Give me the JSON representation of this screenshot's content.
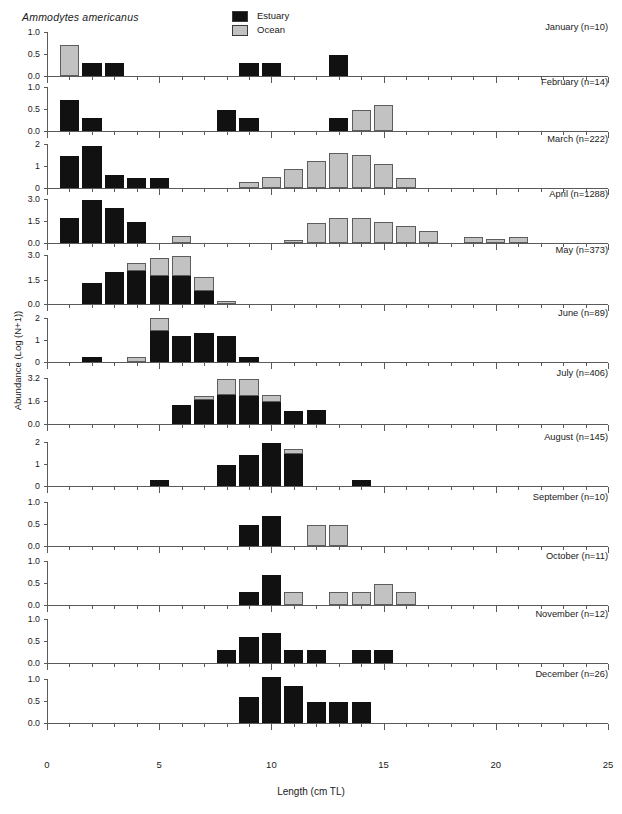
{
  "figure": {
    "species": "Ammodytes americanus",
    "xlabel": "Length (cm TL)",
    "ylabel": "Abundance (Log (N+1))"
  },
  "legend": {
    "position": "top-center",
    "items": [
      {
        "label": "Estuary",
        "color": "#111111",
        "key": "estuary"
      },
      {
        "label": "Ocean",
        "color": "#c2c2c2",
        "key": "ocean"
      }
    ]
  },
  "axes": {
    "x_ticks_major": [
      0,
      5,
      10,
      15,
      20,
      25
    ],
    "x_tick_labels": [
      "0",
      "5",
      "10",
      "15",
      "20",
      "25"
    ],
    "x_minor_step": 1,
    "xlim": [
      0,
      25
    ]
  },
  "chart_data": {
    "type": "bar",
    "title": "Ammodytes americanus",
    "xlabel": "Length (cm TL)",
    "ylabel": "Abundance (Log (N+1))",
    "xlim": [
      0,
      25
    ],
    "grid": false,
    "legend_position": "top-center",
    "stacking": "stacked",
    "series_names": [
      "Estuary",
      "Ocean"
    ],
    "panels": [
      {
        "month": "January",
        "n": 10,
        "title": "January (n=10)",
        "ylim": [
          0,
          1.0
        ],
        "yticks": [
          0.0,
          0.5,
          1.0
        ],
        "ytick_labels": [
          "0.0",
          "0.5",
          "1.0"
        ],
        "estuary": [
          {
            "x": 2,
            "y": 0.3
          },
          {
            "x": 3,
            "y": 0.3
          },
          {
            "x": 9,
            "y": 0.3
          },
          {
            "x": 10,
            "y": 0.3
          },
          {
            "x": 13,
            "y": 0.48
          }
        ],
        "ocean": [
          {
            "x": 1,
            "y": 0.7
          }
        ]
      },
      {
        "month": "February",
        "n": 14,
        "title": "February (n=14)",
        "ylim": [
          0,
          1.0
        ],
        "yticks": [
          0.0,
          0.5,
          1.0
        ],
        "ytick_labels": [
          "0.0",
          "0.5",
          "1.0"
        ],
        "estuary": [
          {
            "x": 1,
            "y": 0.7
          },
          {
            "x": 2,
            "y": 0.3
          },
          {
            "x": 8,
            "y": 0.48
          },
          {
            "x": 9,
            "y": 0.3
          },
          {
            "x": 13,
            "y": 0.3
          }
        ],
        "ocean": [
          {
            "x": 14,
            "y": 0.48
          },
          {
            "x": 15,
            "y": 0.6
          }
        ]
      },
      {
        "month": "March",
        "n": 222,
        "title": "March (n=222)",
        "ylim": [
          0,
          2
        ],
        "yticks": [
          0,
          1,
          2
        ],
        "ytick_labels": [
          "0",
          "1",
          "2"
        ],
        "estuary": [
          {
            "x": 1,
            "y": 1.47
          },
          {
            "x": 2,
            "y": 1.9
          },
          {
            "x": 3,
            "y": 0.6
          },
          {
            "x": 4,
            "y": 0.47
          },
          {
            "x": 5,
            "y": 0.47
          }
        ],
        "ocean": [
          {
            "x": 9,
            "y": 0.28
          },
          {
            "x": 10,
            "y": 0.48
          },
          {
            "x": 11,
            "y": 0.85
          },
          {
            "x": 12,
            "y": 1.25
          },
          {
            "x": 13,
            "y": 1.57
          },
          {
            "x": 14,
            "y": 1.5
          },
          {
            "x": 15,
            "y": 1.1
          },
          {
            "x": 16,
            "y": 0.47
          }
        ]
      },
      {
        "month": "April",
        "n": 1288,
        "title": "April (n=1288)",
        "ylim": [
          0,
          3.0
        ],
        "yticks": [
          0.0,
          1.5,
          3.0
        ],
        "ytick_labels": [
          "0.0",
          "1.5",
          "3.0"
        ],
        "estuary": [
          {
            "x": 1,
            "y": 1.7
          },
          {
            "x": 2,
            "y": 2.9
          },
          {
            "x": 3,
            "y": 2.4
          },
          {
            "x": 4,
            "y": 1.4
          }
        ],
        "ocean": [
          {
            "x": 6,
            "y": 0.5
          },
          {
            "x": 11,
            "y": 0.22
          },
          {
            "x": 12,
            "y": 1.35
          },
          {
            "x": 13,
            "y": 1.7
          },
          {
            "x": 14,
            "y": 1.72
          },
          {
            "x": 15,
            "y": 1.45
          },
          {
            "x": 16,
            "y": 1.18
          },
          {
            "x": 17,
            "y": 0.85
          },
          {
            "x": 19,
            "y": 0.38
          },
          {
            "x": 20,
            "y": 0.25
          },
          {
            "x": 21,
            "y": 0.4
          }
        ]
      },
      {
        "month": "May",
        "n": 373,
        "title": "May (n=373)",
        "ylim": [
          0,
          3.0
        ],
        "yticks": [
          0.0,
          1.5,
          3.0
        ],
        "ytick_labels": [
          "0.0",
          "1.5",
          "3.0"
        ],
        "estuary": [
          {
            "x": 2,
            "y": 1.27
          },
          {
            "x": 3,
            "y": 1.95
          },
          {
            "x": 4,
            "y": 2.05
          },
          {
            "x": 5,
            "y": 1.7
          },
          {
            "x": 6,
            "y": 1.73
          },
          {
            "x": 7,
            "y": 0.8
          }
        ],
        "ocean": [
          {
            "x": 4,
            "y": 0.45
          },
          {
            "x": 5,
            "y": 1.1
          },
          {
            "x": 6,
            "y": 1.22
          },
          {
            "x": 7,
            "y": 0.85
          },
          {
            "x": 8,
            "y": 0.2
          }
        ]
      },
      {
        "month": "June",
        "n": 89,
        "title": "June (n=89)",
        "ylim": [
          0,
          2
        ],
        "yticks": [
          0,
          1,
          2
        ],
        "ytick_labels": [
          "0",
          "1",
          "2"
        ],
        "estuary": [
          {
            "x": 2,
            "y": 0.25
          },
          {
            "x": 5,
            "y": 1.4
          },
          {
            "x": 6,
            "y": 1.2
          },
          {
            "x": 7,
            "y": 1.3
          },
          {
            "x": 8,
            "y": 1.2
          },
          {
            "x": 9,
            "y": 0.25
          }
        ],
        "ocean": [
          {
            "x": 4,
            "y": 0.25
          },
          {
            "x": 5,
            "y": 0.62
          }
        ]
      },
      {
        "month": "July",
        "n": 406,
        "title": "July (n=406)",
        "ylim": [
          0,
          3.2
        ],
        "yticks": [
          0.0,
          1.6,
          3.2
        ],
        "ytick_labels": [
          "0.0",
          "1.6",
          "3.2"
        ],
        "estuary": [
          {
            "x": 6,
            "y": 1.35
          },
          {
            "x": 7,
            "y": 1.7
          },
          {
            "x": 8,
            "y": 2.05
          },
          {
            "x": 9,
            "y": 1.92
          },
          {
            "x": 10,
            "y": 1.5
          },
          {
            "x": 11,
            "y": 0.9
          },
          {
            "x": 12,
            "y": 1.0
          }
        ],
        "ocean": [
          {
            "x": 7,
            "y": 0.22
          },
          {
            "x": 8,
            "y": 1.1
          },
          {
            "x": 9,
            "y": 1.18
          },
          {
            "x": 10,
            "y": 0.55
          }
        ]
      },
      {
        "month": "August",
        "n": 145,
        "title": "August (n=145)",
        "ylim": [
          0,
          2
        ],
        "yticks": [
          0,
          1,
          2
        ],
        "ytick_labels": [
          "0",
          "1",
          "2"
        ],
        "estuary": [
          {
            "x": 5,
            "y": 0.27
          },
          {
            "x": 8,
            "y": 0.95
          },
          {
            "x": 9,
            "y": 1.4
          },
          {
            "x": 10,
            "y": 1.95
          },
          {
            "x": 11,
            "y": 1.45
          },
          {
            "x": 14,
            "y": 0.27
          }
        ],
        "ocean": [
          {
            "x": 11,
            "y": 0.22
          }
        ]
      },
      {
        "month": "September",
        "n": 10,
        "title": "September (n=10)",
        "ylim": [
          0,
          1.0
        ],
        "yticks": [
          0.0,
          0.5,
          1.0
        ],
        "ytick_labels": [
          "0.0",
          "0.5",
          "1.0"
        ],
        "estuary": [
          {
            "x": 9,
            "y": 0.47
          },
          {
            "x": 10,
            "y": 0.68
          }
        ],
        "ocean": [
          {
            "x": 12,
            "y": 0.47
          },
          {
            "x": 13,
            "y": 0.47
          }
        ]
      },
      {
        "month": "October",
        "n": 11,
        "title": "October (n=11)",
        "ylim": [
          0,
          1.0
        ],
        "yticks": [
          0.0,
          0.5,
          1.0
        ],
        "ytick_labels": [
          "0.0",
          "0.5",
          "1.0"
        ],
        "estuary": [
          {
            "x": 9,
            "y": 0.3
          },
          {
            "x": 10,
            "y": 0.68
          }
        ],
        "ocean": [
          {
            "x": 11,
            "y": 0.3
          },
          {
            "x": 13,
            "y": 0.3
          },
          {
            "x": 14,
            "y": 0.3
          },
          {
            "x": 15,
            "y": 0.48
          },
          {
            "x": 16,
            "y": 0.3
          }
        ]
      },
      {
        "month": "November",
        "n": 12,
        "title": "November (n=12)",
        "ylim": [
          0,
          1.0
        ],
        "yticks": [
          0.0,
          0.5,
          1.0
        ],
        "ytick_labels": [
          "0.0",
          "0.5",
          "1.0"
        ],
        "estuary": [
          {
            "x": 8,
            "y": 0.3
          },
          {
            "x": 9,
            "y": 0.58
          },
          {
            "x": 10,
            "y": 0.68
          },
          {
            "x": 11,
            "y": 0.3
          },
          {
            "x": 12,
            "y": 0.3
          },
          {
            "x": 14,
            "y": 0.3
          },
          {
            "x": 15,
            "y": 0.3
          }
        ],
        "ocean": []
      },
      {
        "month": "December",
        "n": 26,
        "title": "December (n=26)",
        "ylim": [
          0,
          1.0
        ],
        "yticks": [
          0.0,
          0.5,
          1.0
        ],
        "ytick_labels": [
          "0.0",
          "0.5",
          "1.0"
        ],
        "estuary": [
          {
            "x": 9,
            "y": 0.58
          },
          {
            "x": 10,
            "y": 1.05
          },
          {
            "x": 11,
            "y": 0.83
          },
          {
            "x": 12,
            "y": 0.47
          },
          {
            "x": 13,
            "y": 0.47
          },
          {
            "x": 14,
            "y": 0.47
          }
        ],
        "ocean": []
      }
    ]
  }
}
